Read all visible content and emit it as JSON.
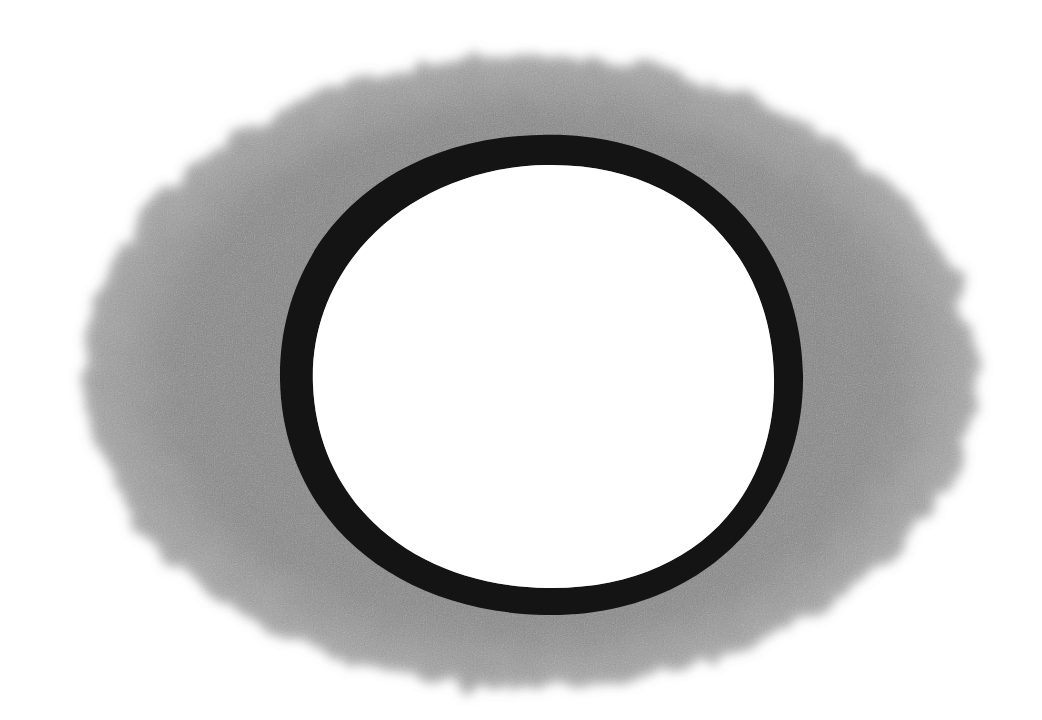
{
  "artwork": {
    "description": "Pencil drawing of a dark ring surrounded by soft gray shading",
    "colors": {
      "background": "#ffffff",
      "shading": "#8a8a8a",
      "ring": "#141414",
      "center": "#ffffff"
    },
    "shading_ellipse": {
      "cx": 530,
      "cy": 372,
      "rx": 445,
      "ry": 315
    },
    "ring_outer": {
      "cx": 540,
      "cy": 375,
      "rx": 262,
      "ry": 240
    },
    "ring_inner": {
      "cx": 543,
      "cy": 378,
      "rx": 232,
      "ry": 212
    }
  }
}
